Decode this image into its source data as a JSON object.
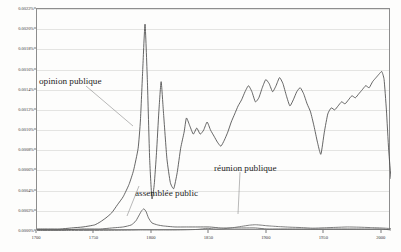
{
  "chart_data": {
    "type": "line",
    "title": "",
    "subtitle": "",
    "xlabel": "",
    "ylabel": "",
    "xlim": [
      1700,
      2008
    ],
    "ylim": [
      0.0,
      0.0022
    ],
    "grid": true,
    "legend_position": "annotations-inline",
    "x_ticks": [
      "1700",
      "1750",
      "1800",
      "1850",
      "1900",
      "1950",
      "2000"
    ],
    "x_tick_values": [
      1700,
      1750,
      1800,
      1850,
      1900,
      1950,
      2000
    ],
    "y_ticks": [
      "0.0000%",
      "0.0002%",
      "0.0004%",
      "0.0006%",
      "0.0008%",
      "0.0010%",
      "0.0012%",
      "0.0014%",
      "0.0016%",
      "0.0018%",
      "0.0020%",
      "0.0022%"
    ],
    "y_tick_values": [
      0.0,
      0.0002,
      0.0004,
      0.0006,
      0.0008,
      0.001,
      0.0012,
      0.0014,
      0.0016,
      0.0018,
      0.002,
      0.0022
    ],
    "annotations": [
      {
        "label": "opinion publique",
        "x": 1742,
        "y": 0.00162
      },
      {
        "label": "assemblée public",
        "x": 1795,
        "y": 0.00042
      },
      {
        "label": "réunion publique",
        "x": 1868,
        "y": 0.00068
      }
    ],
    "series": [
      {
        "name": "opinion publique",
        "color": "#4a4a4a",
        "x": [
          1700,
          1710,
          1720,
          1730,
          1740,
          1750,
          1755,
          1760,
          1765,
          1770,
          1775,
          1780,
          1784,
          1788,
          1790,
          1792,
          1794,
          1796,
          1798,
          1800,
          1802,
          1804,
          1806,
          1808,
          1810,
          1813,
          1816,
          1819,
          1822,
          1825,
          1828,
          1830,
          1833,
          1836,
          1839,
          1842,
          1845,
          1848,
          1851,
          1854,
          1857,
          1860,
          1863,
          1866,
          1869,
          1872,
          1875,
          1878,
          1881,
          1884,
          1887,
          1890,
          1893,
          1896,
          1899,
          1902,
          1905,
          1908,
          1911,
          1914,
          1917,
          1920,
          1923,
          1926,
          1929,
          1932,
          1935,
          1938,
          1941,
          1944,
          1947,
          1950,
          1953,
          1956,
          1959,
          1962,
          1965,
          1968,
          1971,
          1974,
          1977,
          1980,
          1983,
          1986,
          1989,
          1992,
          1995,
          1998,
          2000,
          2002,
          2004,
          2006,
          2008
        ],
        "y": [
          2e-05,
          2e-05,
          2e-05,
          3e-05,
          4e-05,
          6e-05,
          9e-05,
          0.00013,
          0.00018,
          0.00026,
          0.00034,
          0.00046,
          0.0006,
          0.00082,
          0.0011,
          0.0016,
          0.00205,
          0.0015,
          0.00072,
          0.00032,
          0.00046,
          0.00078,
          0.00118,
          0.00148,
          0.00118,
          0.00072,
          0.00048,
          0.00042,
          0.00058,
          0.00082,
          0.00098,
          0.00112,
          0.00104,
          0.00096,
          0.00102,
          0.00096,
          0.001,
          0.00108,
          0.001,
          0.00094,
          0.00088,
          0.00084,
          0.0009,
          0.00098,
          0.00108,
          0.00116,
          0.00124,
          0.0013,
          0.00138,
          0.00144,
          0.00138,
          0.00128,
          0.00132,
          0.00142,
          0.0015,
          0.00146,
          0.00138,
          0.00144,
          0.00152,
          0.00146,
          0.00134,
          0.00124,
          0.0013,
          0.00138,
          0.00142,
          0.00136,
          0.00126,
          0.00118,
          0.00104,
          0.00088,
          0.00076,
          0.00098,
          0.00116,
          0.00122,
          0.0012,
          0.00124,
          0.00128,
          0.00126,
          0.0013,
          0.00134,
          0.00132,
          0.00136,
          0.0014,
          0.00144,
          0.00142,
          0.00148,
          0.00152,
          0.00156,
          0.00158,
          0.0015,
          0.0012,
          0.0008,
          0.00052
        ]
      },
      {
        "name": "assemblée public",
        "color": "#5a5a5a",
        "x": [
          1700,
          1720,
          1740,
          1755,
          1765,
          1775,
          1782,
          1786,
          1789,
          1791,
          1793,
          1795,
          1797,
          1800,
          1805,
          1810,
          1820,
          1830,
          1840,
          1850,
          1860,
          1870,
          1880,
          1890,
          1900,
          1910,
          1920,
          1930,
          1940,
          1950,
          1960,
          1970,
          1980,
          1990,
          2000,
          2008
        ],
        "y": [
          1e-05,
          1e-05,
          2e-05,
          2e-05,
          3e-05,
          4e-05,
          6e-05,
          0.0001,
          0.00016,
          0.0002,
          0.00022,
          0.00019,
          0.00013,
          8e-05,
          6e-05,
          5e-05,
          4e-05,
          4e-05,
          4e-05,
          4e-05,
          3e-05,
          3e-05,
          3e-05,
          3e-05,
          2e-05,
          2e-05,
          2e-05,
          2e-05,
          2e-05,
          2e-05,
          2e-05,
          2e-05,
          2e-05,
          2e-05,
          2e-05,
          1e-05
        ]
      },
      {
        "name": "réunion publique",
        "color": "#6a6a6a",
        "x": [
          1700,
          1730,
          1760,
          1780,
          1790,
          1800,
          1810,
          1820,
          1830,
          1840,
          1848,
          1855,
          1862,
          1870,
          1878,
          1885,
          1890,
          1895,
          1900,
          1905,
          1910,
          1920,
          1930,
          1940,
          1950,
          1960,
          1970,
          1980,
          1990,
          2000,
          2008
        ],
        "y": [
          5e-06,
          5e-06,
          6e-06,
          8e-06,
          1e-05,
          1e-05,
          1e-05,
          1e-05,
          1.2e-05,
          1.6e-05,
          2.6e-05,
          2e-05,
          2.2e-05,
          3.2e-05,
          4.6e-05,
          5.8e-05,
          6.2e-05,
          5.8e-05,
          5.2e-05,
          4.8e-05,
          4.4e-05,
          3.8e-05,
          3.4e-05,
          2.8e-05,
          3.2e-05,
          3.6e-05,
          4e-05,
          3.8e-05,
          3.4e-05,
          3e-05,
          2.4e-05
        ]
      }
    ]
  }
}
